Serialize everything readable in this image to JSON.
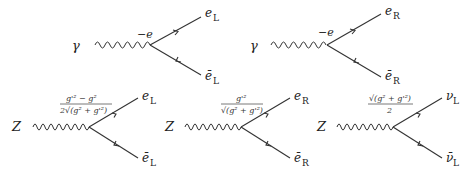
{
  "diagrams": [
    {
      "id": "photon-eL",
      "boson": "γ",
      "coupling": "−e",
      "fermion_out": {
        "symbol": "e",
        "sub": "L"
      },
      "fermion_in": {
        "symbol": "ē",
        "sub": "L"
      }
    },
    {
      "id": "photon-eR",
      "boson": "γ",
      "coupling": "−e",
      "fermion_out": {
        "symbol": "e",
        "sub": "R"
      },
      "fermion_in": {
        "symbol": "ē",
        "sub": "R"
      }
    },
    {
      "id": "Z-eL",
      "boson": "Z",
      "coupling_num": "g'² − g²",
      "coupling_den": "2√(g² + g'²)",
      "fermion_out": {
        "symbol": "e",
        "sub": "L"
      },
      "fermion_in": {
        "symbol": "ē",
        "sub": "L"
      }
    },
    {
      "id": "Z-eR",
      "boson": "Z",
      "coupling_num": "g'²",
      "coupling_den": "√(g² + g'²)",
      "fermion_out": {
        "symbol": "e",
        "sub": "R"
      },
      "fermion_in": {
        "symbol": "ē",
        "sub": "R"
      }
    },
    {
      "id": "Z-nuL",
      "boson": "Z",
      "coupling_num": "√(g² + g'²)",
      "coupling_den": "2",
      "fermion_out": {
        "symbol": "ν",
        "sub": "L"
      },
      "fermion_in": {
        "symbol": "ν̄",
        "sub": "L"
      }
    }
  ]
}
